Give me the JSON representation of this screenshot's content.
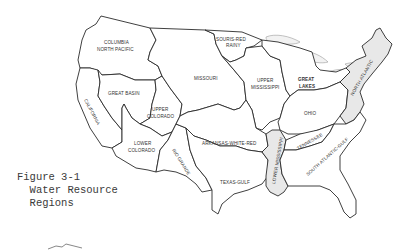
{
  "figure": {
    "caption_line1": "Figure 3-1",
    "caption_line2": "  Water Resource",
    "caption_line3": "  Regions"
  },
  "regions": [
    {
      "id": "columbia-north-pacific",
      "label_lines": [
        "COLUMBIA",
        "NORTH PACIFIC"
      ]
    },
    {
      "id": "california",
      "label_lines": [
        "CALIFORNIA"
      ]
    },
    {
      "id": "great-basin",
      "label_lines": [
        "GREAT BASIN"
      ]
    },
    {
      "id": "upper-colorado",
      "label_lines": [
        "UPPER",
        "COLORADO"
      ]
    },
    {
      "id": "lower-colorado",
      "label_lines": [
        "LOWER",
        "COLORADO"
      ]
    },
    {
      "id": "rio-grande",
      "label_lines": [
        "RIO GRANDE"
      ]
    },
    {
      "id": "missouri",
      "label_lines": [
        "MISSOURI"
      ]
    },
    {
      "id": "souris-red-rainy",
      "label_lines": [
        "SOURIS-RED",
        "RAINY"
      ]
    },
    {
      "id": "upper-mississippi",
      "label_lines": [
        "UPPER",
        "MISSISSIPPI"
      ]
    },
    {
      "id": "great-lakes",
      "label_lines": [
        "GREAT",
        "LAKES"
      ]
    },
    {
      "id": "ohio",
      "label_lines": [
        "OHIO"
      ]
    },
    {
      "id": "north-atlantic",
      "label_lines": [
        "NORTH ATLANTIC"
      ]
    },
    {
      "id": "arkansas-white-red",
      "label_lines": [
        "ARKANSAS-WHITE-RED"
      ]
    },
    {
      "id": "texas-gulf",
      "label_lines": [
        "TEXAS-GULF"
      ]
    },
    {
      "id": "lower-mississippi",
      "label_lines": [
        "LOWER MISSISSIPPI"
      ]
    },
    {
      "id": "tennessee",
      "label_lines": [
        "TENNESSEE"
      ]
    },
    {
      "id": "south-atlantic-gulf",
      "label_lines": [
        "SOUTH ATLANTIC-GULF"
      ]
    }
  ]
}
